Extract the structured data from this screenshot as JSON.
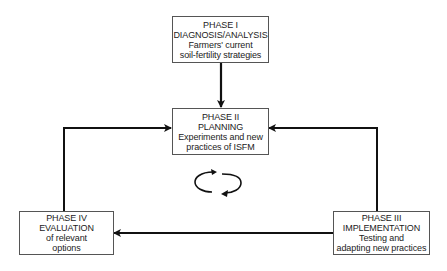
{
  "diagram": {
    "type": "cycle-flow",
    "nodes": [
      {
        "id": "phase1",
        "lines": [
          "PHASE I",
          "DIAGNOSIS/ANALYSIS",
          "Farmers' current",
          "soil-fertility strategies"
        ]
      },
      {
        "id": "phase2",
        "lines": [
          "PHASE II",
          "PLANNING",
          "Experiments and new",
          "practices of ISFM"
        ]
      },
      {
        "id": "phase3",
        "lines": [
          "PHASE III",
          "IMPLEMENTATION",
          "Testing and",
          "adapting new practices"
        ]
      },
      {
        "id": "phase4",
        "lines": [
          "PHASE IV",
          "EVALUATION",
          "of relevant",
          "options"
        ]
      }
    ],
    "edges": [
      {
        "from": "phase1",
        "to": "phase2"
      },
      {
        "from": "phase3",
        "to": "phase2"
      },
      {
        "from": "phase3",
        "to": "phase4"
      },
      {
        "from": "phase4",
        "to": "phase2"
      }
    ],
    "center_icon": "cycle-arrows-icon",
    "colors": {
      "line": "#111111",
      "box_border": "#555555",
      "text": "#222222",
      "background": "#ffffff"
    }
  }
}
